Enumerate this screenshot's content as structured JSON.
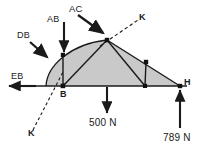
{
  "figure": {
    "type": "structural-truss-free-body-diagram",
    "background_color": "#ffffff",
    "line_color": "#1a1a1a",
    "fill_color": "#c9c9c9",
    "title": ""
  },
  "labels": {
    "ab": "AB",
    "ac": "AC",
    "db": "DB",
    "eb": "EB",
    "k_top": "K",
    "k_bottom": "K",
    "node_b": "B",
    "node_h": "H",
    "load_500": "500 N",
    "load_789": "789 N"
  },
  "nodes": [
    {
      "id": "B",
      "x": 63,
      "y": 86,
      "label": "B"
    },
    {
      "id": "B2",
      "x": 63,
      "y": 55,
      "label": ""
    },
    {
      "id": "C",
      "x": 107,
      "y": 40,
      "label": ""
    },
    {
      "id": "F",
      "x": 146,
      "y": 62,
      "label": ""
    },
    {
      "id": "G",
      "x": 145,
      "y": 86,
      "label": ""
    },
    {
      "id": "H",
      "x": 180,
      "y": 86,
      "label": "H"
    }
  ],
  "members": [
    {
      "from": "B",
      "to": "B2"
    },
    {
      "from": "B",
      "to": "C"
    },
    {
      "from": "B2",
      "to": "C"
    },
    {
      "from": "C",
      "to": "G"
    },
    {
      "from": "C",
      "to": "F"
    },
    {
      "from": "F",
      "to": "G"
    },
    {
      "from": "F",
      "to": "H"
    },
    {
      "from": "G",
      "to": "H"
    },
    {
      "from": "B",
      "to": "G"
    }
  ],
  "forces": [
    {
      "name": "AB",
      "label": "AB",
      "direction": "down",
      "applied_at_x": 63,
      "applied_at_y": 55
    },
    {
      "name": "AC",
      "label": "AC",
      "direction": "down-right",
      "applied_at_x": 107,
      "applied_at_y": 40
    },
    {
      "name": "DB",
      "label": "DB",
      "direction": "down-right",
      "applied_at_x": 47,
      "applied_at_y": 68
    },
    {
      "name": "EB",
      "label": "EB",
      "direction": "left",
      "applied_at_x": 36,
      "applied_at_y": 86
    },
    {
      "name": "500 N",
      "label": "500 N",
      "direction": "down",
      "applied_at_x": 107,
      "applied_at_y": 86
    },
    {
      "name": "789 N",
      "label": "789 N",
      "direction": "up",
      "applied_at_x": 180,
      "applied_at_y": 86
    }
  ],
  "section_line": {
    "label": "K-K",
    "style": "dashed",
    "top_label": "K",
    "bottom_label": "K"
  }
}
